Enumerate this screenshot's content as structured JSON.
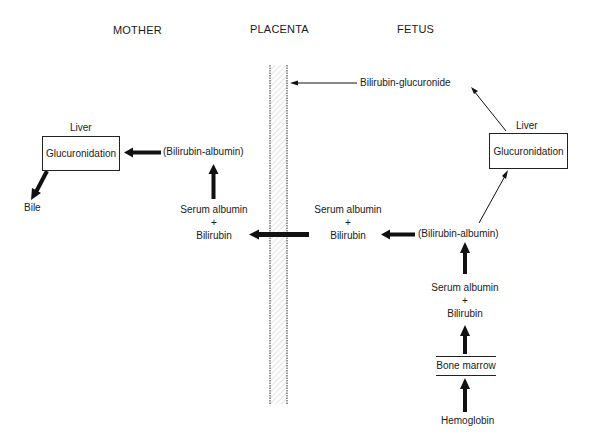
{
  "headers": {
    "mother": "MOTHER",
    "placenta": "PLACENTA",
    "fetus": "FETUS"
  },
  "mother": {
    "liver_label": "Liver",
    "liver_process": "Glucuronidation",
    "bile": "Bile",
    "complex": "(Bilirubin-albumin)",
    "serum_albumin": "Serum albumin",
    "plus": "+",
    "bilirubin": "Bilirubin"
  },
  "fetus": {
    "glucuronide": "Bilirubin-glucuronide",
    "liver_label": "Liver",
    "liver_process": "Glucuronidation",
    "serum_albumin_near": "Serum albumin",
    "plus_near": "+",
    "bilirubin_near": "Bilirubin",
    "complex": "(Bilirubin-albumin)",
    "serum_albumin_lower": "Serum albumin",
    "plus_lower": "+",
    "bilirubin_lower": "Bilirubin",
    "bone_marrow": "Bone marrow",
    "hemoglobin": "Hemoglobin"
  },
  "colors": {
    "ink": "#1a1a1a",
    "placenta_hatch": "#cfcfcf"
  }
}
